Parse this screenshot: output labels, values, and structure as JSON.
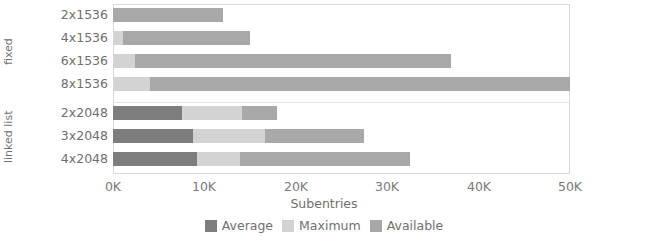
{
  "chart_data": {
    "type": "bar",
    "orientation": "horizontal",
    "stacked": true,
    "title": "",
    "xlabel": "Subentries",
    "ylabel": "",
    "xlim": [
      0,
      50000
    ],
    "xticks": [
      "0K",
      "10K",
      "20K",
      "30K",
      "40K",
      "50K"
    ],
    "xtick_values": [
      0,
      10000,
      20000,
      30000,
      40000,
      50000
    ],
    "grid": true,
    "legend_position": "bottom",
    "groups": [
      {
        "name": "fixed",
        "categories": [
          "2x1536",
          "4x1536",
          "6x1536",
          "8x1536"
        ]
      },
      {
        "name": "linked list",
        "categories": [
          "2x2048",
          "3x2048",
          "4x2048"
        ]
      }
    ],
    "categories": [
      "2x1536",
      "4x1536",
      "6x1536",
      "8x1536",
      "2x2048",
      "3x2048",
      "4x2048"
    ],
    "series": [
      {
        "name": "Average",
        "color": "#7d7d7d",
        "values": [
          0,
          0,
          0,
          0,
          7500,
          8700,
          9200
        ]
      },
      {
        "name": "Maximum",
        "color": "#d3d3d3",
        "values": [
          0,
          1100,
          2400,
          4000,
          6600,
          7900,
          4700
        ]
      },
      {
        "name": "Available",
        "color": "#a8a8a8",
        "values": [
          12000,
          13900,
          34600,
          46000,
          3800,
          10900,
          18600
        ]
      }
    ],
    "totals": [
      12000,
      15000,
      37000,
      50000,
      17900,
      27500,
      32500
    ]
  },
  "axis": {
    "x_label": "Subentries",
    "ticks": [
      {
        "label": "0K",
        "value": 0
      },
      {
        "label": "10K",
        "value": 10000
      },
      {
        "label": "20K",
        "value": 20000
      },
      {
        "label": "30K",
        "value": 30000
      },
      {
        "label": "40K",
        "value": 40000
      },
      {
        "label": "50K",
        "value": 50000
      }
    ]
  },
  "groups": [
    {
      "label": "fixed"
    },
    {
      "label": "linked list"
    }
  ],
  "rows": [
    {
      "label": "2x1536",
      "group": "fixed",
      "average": 0,
      "maximum": 0,
      "available": 12000
    },
    {
      "label": "4x1536",
      "group": "fixed",
      "average": 0,
      "maximum": 1100,
      "available": 13900
    },
    {
      "label": "6x1536",
      "group": "fixed",
      "average": 0,
      "maximum": 2400,
      "available": 34600
    },
    {
      "label": "8x1536",
      "group": "fixed",
      "average": 0,
      "maximum": 4000,
      "available": 46000
    },
    {
      "label": "2x2048",
      "group": "linked list",
      "average": 7500,
      "maximum": 6600,
      "available": 3800
    },
    {
      "label": "3x2048",
      "group": "linked list",
      "average": 8700,
      "maximum": 7900,
      "available": 10900
    },
    {
      "label": "4x2048",
      "group": "linked list",
      "average": 9200,
      "maximum": 4700,
      "available": 18600
    }
  ],
  "legend": [
    {
      "label": "Average",
      "color": "#7d7d7d"
    },
    {
      "label": "Maximum",
      "color": "#d3d3d3"
    },
    {
      "label": "Available",
      "color": "#a8a8a8"
    }
  ]
}
